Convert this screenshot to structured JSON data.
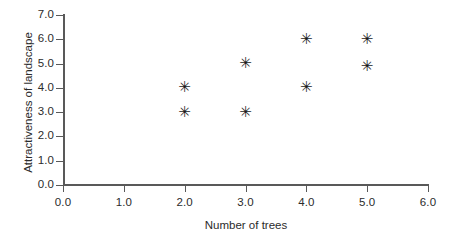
{
  "chart_data": {
    "type": "scatter",
    "title": "",
    "xlabel": "Number of trees",
    "ylabel": "Attractiveness of landscape",
    "xlim": [
      0.0,
      6.0
    ],
    "ylim": [
      0.0,
      7.0
    ],
    "xticks": [
      "0.0",
      "1.0",
      "2.0",
      "3.0",
      "4.0",
      "5.0",
      "6.0"
    ],
    "xtick_values": [
      0.0,
      1.0,
      2.0,
      3.0,
      4.0,
      5.0,
      6.0
    ],
    "yticks": [
      "0.0",
      "1.0",
      "2.0",
      "3.0",
      "4.0",
      "5.0",
      "6.0",
      "7.0"
    ],
    "ytick_values": [
      0.0,
      1.0,
      2.0,
      3.0,
      4.0,
      5.0,
      6.0,
      7.0
    ],
    "grid": false,
    "legend": false,
    "marker": "asterisk",
    "marker_glyph": "✳",
    "marker_color": "#1a1a1a",
    "axis_color": "#595959",
    "points": [
      {
        "x": 2.0,
        "y": 4.0
      },
      {
        "x": 2.0,
        "y": 3.0
      },
      {
        "x": 3.0,
        "y": 5.0
      },
      {
        "x": 3.0,
        "y": 3.0
      },
      {
        "x": 4.0,
        "y": 6.0
      },
      {
        "x": 4.0,
        "y": 4.0
      },
      {
        "x": 5.0,
        "y": 6.0
      },
      {
        "x": 5.0,
        "y": 4.9
      }
    ]
  }
}
